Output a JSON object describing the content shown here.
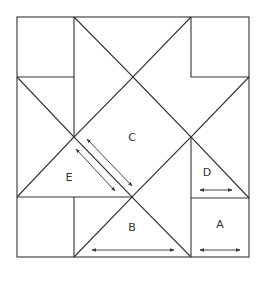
{
  "diagram": {
    "title": "",
    "type": "quilt-block-pattern",
    "labels": {
      "A": "A",
      "B": "B",
      "C": "C",
      "D": "D",
      "E": "E"
    },
    "arrows": [
      {
        "id": "grain-arrow-c",
        "from": [
          87,
          139
        ],
        "to": [
          132,
          186
        ]
      },
      {
        "id": "grain-arrow-e",
        "from": [
          76,
          149
        ],
        "to": [
          115,
          191
        ]
      },
      {
        "id": "grain-arrow-b",
        "from": [
          92,
          250
        ],
        "to": [
          174,
          250
        ]
      },
      {
        "id": "grain-arrow-d",
        "from": [
          200,
          190
        ],
        "to": [
          232,
          190
        ]
      },
      {
        "id": "grain-arrow-a",
        "from": [
          200,
          250
        ],
        "to": [
          240,
          250
        ]
      }
    ]
  }
}
